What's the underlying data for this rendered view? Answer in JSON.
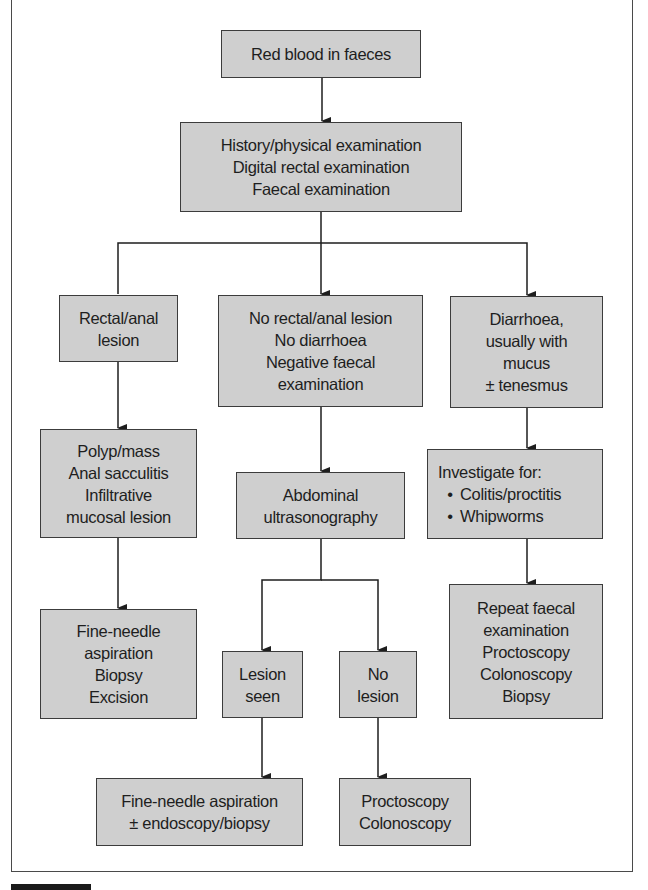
{
  "flowchart": {
    "nodes": {
      "start": {
        "lines": [
          "Red blood in faeces"
        ]
      },
      "initial_workup": {
        "lines": [
          "History/physical examination",
          "Digital rectal examination",
          "Faecal examination"
        ]
      },
      "rectal_lesion": {
        "lines": [
          "Rectal/anal",
          "lesion"
        ]
      },
      "no_lesion_no_diarrhoea": {
        "lines": [
          "No rectal/anal lesion",
          "No diarrhoea",
          "Negative faecal",
          "examination"
        ]
      },
      "diarrhoea": {
        "lines": [
          "Diarrhoea,",
          "usually with",
          "mucus",
          "± tenesmus"
        ]
      },
      "polyp_mass": {
        "lines": [
          "Polyp/mass",
          "Anal sacculitis",
          "Infiltrative",
          "mucosal lesion"
        ]
      },
      "abdominal_us": {
        "lines": [
          "Abdominal",
          "ultrasonography"
        ]
      },
      "investigate": {
        "heading": "Investigate for:",
        "bullets": [
          "Colitis/proctitis",
          "Whipworms"
        ]
      },
      "fna_biopsy_excision": {
        "lines": [
          "Fine-needle",
          "aspiration",
          "Biopsy",
          "Excision"
        ]
      },
      "lesion_seen": {
        "lines": [
          "Lesion",
          "seen"
        ]
      },
      "no_lesion": {
        "lines": [
          "No",
          "lesion"
        ]
      },
      "repeat_workup": {
        "lines": [
          "Repeat faecal",
          "examination",
          "Proctoscopy",
          "Colonoscopy",
          "Biopsy"
        ]
      },
      "fna_endoscopy": {
        "lines": [
          "Fine-needle aspiration",
          "± endoscopy/biopsy"
        ]
      },
      "proctoscopy_colonoscopy": {
        "lines": [
          "Proctoscopy",
          "Colonoscopy"
        ]
      }
    },
    "edges": [
      [
        "start",
        "initial_workup"
      ],
      [
        "initial_workup",
        "rectal_lesion"
      ],
      [
        "initial_workup",
        "no_lesion_no_diarrhoea"
      ],
      [
        "initial_workup",
        "diarrhoea"
      ],
      [
        "rectal_lesion",
        "polyp_mass"
      ],
      [
        "no_lesion_no_diarrhoea",
        "abdominal_us"
      ],
      [
        "diarrhoea",
        "investigate"
      ],
      [
        "polyp_mass",
        "fna_biopsy_excision"
      ],
      [
        "abdominal_us",
        "lesion_seen"
      ],
      [
        "abdominal_us",
        "no_lesion"
      ],
      [
        "investigate",
        "repeat_workup"
      ],
      [
        "lesion_seen",
        "fna_endoscopy"
      ],
      [
        "no_lesion",
        "proctoscopy_colonoscopy"
      ]
    ],
    "colors": {
      "box_fill": "#cfcfcf",
      "box_border": "#3c3c3c",
      "line": "#1e1e1e"
    }
  }
}
